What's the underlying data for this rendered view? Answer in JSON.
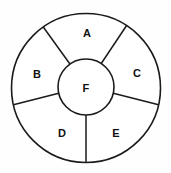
{
  "diagram": {
    "type": "concentric-circle-sector-diagram",
    "canvas": {
      "width": 171,
      "height": 173,
      "background": "#fefefe"
    },
    "style": {
      "stroke_color": "#1a1a1a",
      "fill_color": "#ffffff",
      "stroke_width": 1.6,
      "label_color": "#111111"
    },
    "outer_circle": {
      "cx": 86,
      "cy": 88,
      "r": 74.5
    },
    "inner_circle": {
      "cx": 86,
      "cy": 87,
      "r": 28
    },
    "dividers": [
      {
        "name": "divider-a-b",
        "angle_deg": 125
      },
      {
        "name": "divider-a-c",
        "angle_deg": 57
      },
      {
        "name": "divider-b-d",
        "angle_deg": 193
      },
      {
        "name": "divider-c-e",
        "angle_deg": 347
      },
      {
        "name": "divider-d-e",
        "angle_deg": 270
      }
    ],
    "segments": [
      {
        "id": "A",
        "label": "A",
        "position": "top",
        "label_x": 87,
        "label_y": 33,
        "start_deg": 57,
        "end_deg": 125
      },
      {
        "id": "B",
        "label": "B",
        "position": "left",
        "label_x": 37,
        "label_y": 74,
        "start_deg": 125,
        "end_deg": 193
      },
      {
        "id": "C",
        "label": "C",
        "position": "right",
        "label_x": 137,
        "label_y": 73,
        "start_deg": 347,
        "end_deg": 57
      },
      {
        "id": "D",
        "label": "D",
        "position": "bottom-left",
        "label_x": 62,
        "label_y": 133,
        "start_deg": 193,
        "end_deg": 270
      },
      {
        "id": "E",
        "label": "E",
        "position": "bottom-right",
        "label_x": 116,
        "label_y": 133,
        "start_deg": 270,
        "end_deg": 347
      },
      {
        "id": "F",
        "label": "F",
        "position": "center",
        "label_x": 86,
        "label_y": 88,
        "start_deg": 0,
        "end_deg": 360
      }
    ]
  }
}
